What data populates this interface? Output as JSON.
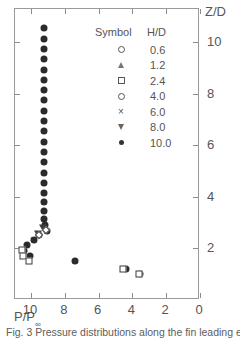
{
  "figure": {
    "caption": "Fig. 3  Pressure distributions along the fin leading ed"
  },
  "chart_data": {
    "type": "scatter",
    "title": "",
    "subtitle": "",
    "xlabel": "P/P∞",
    "ylabel": "Z/D",
    "xlim": [
      10.95,
      0
    ],
    "ylim": [
      0,
      11.3
    ],
    "xticks": [
      10,
      8,
      6,
      4,
      2,
      0
    ],
    "xtick_labels": [
      "10",
      "8",
      "6",
      "4",
      "2",
      "0"
    ],
    "yticks": [
      2,
      4,
      6,
      8,
      10
    ],
    "ytick_labels": [
      "2",
      "4",
      "6",
      "8",
      "10"
    ],
    "x_axis_reversed": true,
    "grid": false,
    "legend_position": "inside-top-center",
    "legend_title_symbol": "Symbol",
    "legend_title_value": "H/D",
    "legend": [
      {
        "label": "0.6",
        "marker": "circle-open"
      },
      {
        "label": "1.2",
        "marker": "triangle-up-open"
      },
      {
        "label": "2.4",
        "marker": "square-open"
      },
      {
        "label": "4.0",
        "marker": "diamond-open"
      },
      {
        "label": "6.0",
        "marker": "cross"
      },
      {
        "label": "8.0",
        "marker": "triangle-down-open"
      },
      {
        "label": "10.0",
        "marker": "circle-filled"
      }
    ],
    "series": [
      {
        "name": "H/D = 10.0",
        "marker": "circle-filled",
        "points": [
          [
            9.25,
            10.55
          ],
          [
            9.25,
            10.15
          ],
          [
            9.25,
            9.75
          ],
          [
            9.25,
            9.35
          ],
          [
            9.25,
            8.95
          ],
          [
            9.25,
            8.55
          ],
          [
            9.25,
            8.15
          ],
          [
            9.25,
            7.75
          ],
          [
            9.25,
            7.35
          ],
          [
            9.25,
            6.95
          ],
          [
            9.25,
            6.55
          ],
          [
            9.25,
            6.15
          ],
          [
            9.25,
            5.75
          ],
          [
            9.25,
            5.35
          ],
          [
            9.25,
            4.95
          ],
          [
            9.25,
            4.55
          ],
          [
            9.25,
            4.15
          ],
          [
            9.25,
            3.8
          ],
          [
            9.25,
            3.45
          ],
          [
            9.22,
            3.15
          ],
          [
            9.18,
            2.9
          ],
          [
            9.05,
            2.68
          ],
          [
            9.55,
            2.52
          ],
          [
            9.85,
            2.33
          ],
          [
            10.25,
            2.12
          ],
          [
            10.4,
            1.92
          ],
          [
            10.05,
            1.7
          ],
          [
            7.4,
            1.5
          ],
          [
            4.4,
            1.22
          ],
          [
            3.55,
            1.02
          ]
        ]
      },
      {
        "name": "H/D = 8.0",
        "marker": "triangle-down-open",
        "points": [
          [
            9.3,
            2.78
          ],
          [
            9.6,
            2.58
          ]
        ]
      },
      {
        "name": "H/D = 6.0",
        "marker": "cross",
        "points": [
          [
            9.9,
            2.35
          ],
          [
            10.05,
            1.7
          ]
        ]
      },
      {
        "name": "H/D = 4.0",
        "marker": "diamond-open",
        "points": [
          [
            9.1,
            2.7
          ],
          [
            9.55,
            2.52
          ]
        ]
      },
      {
        "name": "H/D = 2.4",
        "marker": "square-open",
        "points": [
          [
            10.55,
            1.95
          ],
          [
            10.45,
            1.72
          ],
          [
            10.1,
            1.52
          ],
          [
            4.55,
            1.22
          ],
          [
            3.6,
            1.02
          ]
        ]
      },
      {
        "name": "H/D = 1.2",
        "marker": "triangle-up-open",
        "points": []
      },
      {
        "name": "H/D = 0.6",
        "marker": "circle-open",
        "points": []
      }
    ]
  }
}
